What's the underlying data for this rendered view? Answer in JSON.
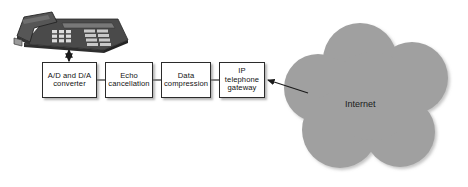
{
  "diagram": {
    "background_color": "#ffffff",
    "cloud": {
      "label": "Internet",
      "fill_color": "#a0a0a0",
      "label_color": "#1a1a1a"
    },
    "device": {
      "name": "desk telephone",
      "body_color": "#3a3a3a",
      "keypad_color": "#d8d8d8"
    },
    "boxes": [
      {
        "id": "ad-da-converter",
        "label": "A/D and D/A\nconverter",
        "x": 42,
        "y": 62,
        "w": 55,
        "h": 36
      },
      {
        "id": "echo-cancellation",
        "label": "Echo\ncancellation",
        "x": 105,
        "y": 62,
        "w": 48,
        "h": 36
      },
      {
        "id": "data-compression",
        "label": "Data\ncompression",
        "x": 161,
        "y": 62,
        "w": 50,
        "h": 36
      },
      {
        "id": "ip-telephone-gateway",
        "label": "IP\ntelephone\ngateway",
        "x": 219,
        "y": 62,
        "w": 46,
        "h": 36
      }
    ],
    "connectors": [
      {
        "id": "phone-to-converter",
        "type": "double-arrow-vertical",
        "from": "desk telephone",
        "to": "A/D and D/A converter"
      },
      {
        "id": "converter-to-echo",
        "type": "line",
        "from": "A/D and D/A converter",
        "to": "Echo cancellation"
      },
      {
        "id": "echo-to-compression",
        "type": "line",
        "from": "Echo cancellation",
        "to": "Data compression"
      },
      {
        "id": "compression-to-gateway",
        "type": "line",
        "from": "Data compression",
        "to": "IP telephone gateway"
      },
      {
        "id": "cloud-to-gateway",
        "type": "arrow-diagonal",
        "from": "Internet",
        "to": "IP telephone gateway"
      }
    ]
  }
}
